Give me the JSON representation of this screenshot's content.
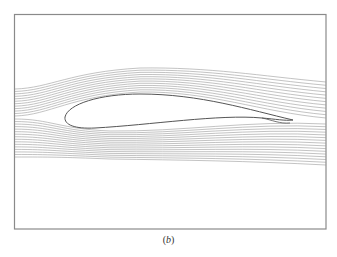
{
  "figure": {
    "caption_open": "(",
    "caption_letter": "b",
    "caption_close": ")"
  },
  "colors": {
    "frame": "#8a8a8a",
    "streamline": "#9a9a9a",
    "airfoil": "#555555",
    "background": "#ffffff"
  },
  "diagram": {
    "frame": {
      "x": 14,
      "y": 14,
      "width": 312,
      "height": 215
    },
    "upper_streamline_count": 12,
    "lower_streamline_count": 16,
    "airfoil": {
      "leading_edge": [
        65,
        120
      ],
      "trailing_edge": [
        293,
        120
      ]
    }
  }
}
